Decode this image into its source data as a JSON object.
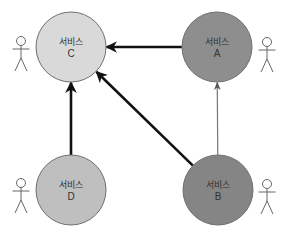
{
  "diagram": {
    "type": "service-dependency",
    "nodes": [
      {
        "id": "C",
        "label": "서비스",
        "name": "C",
        "fill": "#d9d9d9"
      },
      {
        "id": "A",
        "label": "서비스",
        "name": "A",
        "fill": "#8e8e8e"
      },
      {
        "id": "D",
        "label": "서비스",
        "name": "D",
        "fill": "#bfbfbf"
      },
      {
        "id": "B",
        "label": "서비스",
        "name": "B",
        "fill": "#858585"
      }
    ],
    "edges": [
      {
        "from": "A",
        "to": "C",
        "style": "thick",
        "color": "#111111"
      },
      {
        "from": "B",
        "to": "C",
        "style": "thick",
        "color": "#111111"
      },
      {
        "from": "D",
        "to": "C",
        "style": "thick",
        "color": "#111111"
      },
      {
        "from": "B",
        "to": "A",
        "style": "thin",
        "color": "#777777"
      }
    ],
    "actors": [
      {
        "attached_to": "C",
        "icon": "user-actor-icon"
      },
      {
        "attached_to": "A",
        "icon": "user-actor-icon"
      },
      {
        "attached_to": "D",
        "icon": "user-actor-icon"
      },
      {
        "attached_to": "B",
        "icon": "user-actor-icon"
      }
    ]
  }
}
